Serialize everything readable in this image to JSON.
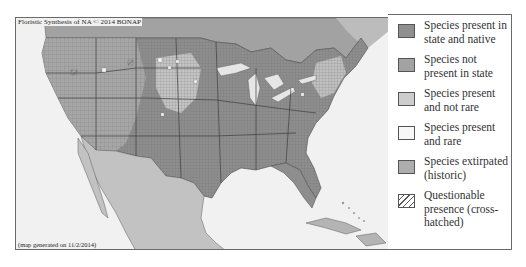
{
  "map": {
    "title": "Floristic Synthesis of NA © 2014 BONAP",
    "footer": "(map generated on 11/2/2014)",
    "colors": {
      "background_water": "#f1f1f1",
      "present_native": "#8c8c8c",
      "not_present": "#a6a6a6",
      "present_not_rare": "#c6c6c6",
      "present_rare": "#f6f6f6",
      "extirpated": "#b4b4b4",
      "boundary": "#5a5a5a"
    }
  },
  "legend": {
    "items": [
      {
        "label": "Species present in state and native",
        "swatch_color": "#8f8f8f",
        "pattern": "solid"
      },
      {
        "label": "Species not present in state",
        "swatch_color": "#a3a3a3",
        "pattern": "solid"
      },
      {
        "label": "Species present and not rare",
        "swatch_color": "#cdcdcd",
        "pattern": "solid"
      },
      {
        "label": "Species present and rare",
        "swatch_color": "#f7f7f7",
        "pattern": "solid"
      },
      {
        "label": "Species extirpated (historic)",
        "swatch_color": "#adadad",
        "pattern": "solid"
      },
      {
        "label": "Questionable presence (cross-hatched)",
        "swatch_color": "#ffffff",
        "pattern": "hatched"
      }
    ]
  }
}
